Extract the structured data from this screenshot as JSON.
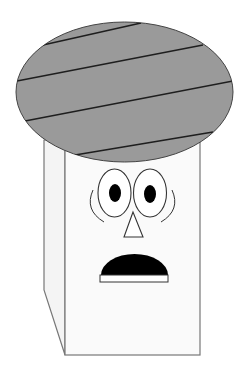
{
  "scene": {
    "subject": "cartoon box character with striped hat and surprised face",
    "width": 247,
    "height": 374,
    "background": "#ffffff"
  },
  "colors": {
    "hat_fill": "#9a9a9a",
    "outline": "#333333",
    "stripe": "#1e1e1e",
    "body_fill": "#fafafa",
    "side_fill": "#f4f4f4",
    "box_outline": "#777777",
    "eye_white": "#ffffff",
    "pupil": "#000000",
    "mouth": "#000000"
  },
  "hat": {
    "cx": 124.5,
    "cy": 92,
    "rx": 108.5,
    "ry": 70,
    "stripes": [
      {
        "x1": 43,
        "y1": 45,
        "x2": 141,
        "y2": 23
      },
      {
        "x1": 17,
        "y1": 81,
        "x2": 203,
        "y2": 45
      },
      {
        "x1": 25,
        "y1": 121,
        "x2": 233,
        "y2": 81
      },
      {
        "x1": 75,
        "y1": 155,
        "x2": 213,
        "y2": 132
      }
    ]
  },
  "box": {
    "front": {
      "x": 65,
      "y": 140,
      "width": 135,
      "height": 215
    },
    "side_points": "44,140 65,140 65,355 44,290"
  },
  "face": {
    "left_eye": {
      "cx": 114.5,
      "cy": 193,
      "rx": 16.5,
      "ry": 24
    },
    "right_eye": {
      "cx": 150,
      "cy": 193,
      "rx": 16.5,
      "ry": 24
    },
    "left_pupil": {
      "cx": 115,
      "cy": 193,
      "rx": 6,
      "ry": 9
    },
    "right_pupil": {
      "cx": 150,
      "cy": 194,
      "rx": 6,
      "ry": 9
    },
    "nose_points": "133,212 124,237 143,237",
    "mouth_path": "M101,275 A33.5,21 0 0 1 168,275 Z",
    "mouth_strip": {
      "x": 100,
      "y": 275,
      "width": 68,
      "height": 7
    }
  }
}
